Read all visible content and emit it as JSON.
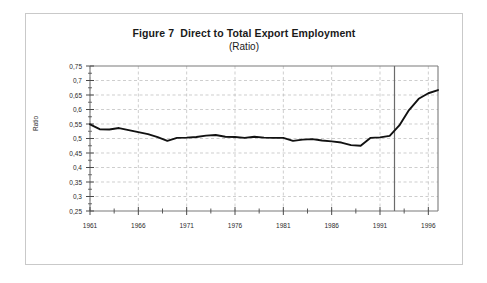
{
  "figure": {
    "title": "Figure 7  Direct to Total Export Employment",
    "subtitle": "(Ratio)",
    "border_color": "#c9c9c9",
    "background": "#ffffff"
  },
  "axes": {
    "y_title": "Ratio",
    "y_ticks": [
      "0,75",
      "0,7",
      "0,65",
      "0,6",
      "0,55",
      "0,5",
      "0,45",
      "0,4",
      "0,35",
      "0,3",
      "0,25"
    ],
    "x_ticks": [
      "1961",
      "1966",
      "1971",
      "1976",
      "1981",
      "1986",
      "1991",
      "1996"
    ]
  },
  "chart_data": {
    "type": "line",
    "title": "Figure 7  Direct to Total Export Employment",
    "subtitle": "(Ratio)",
    "xlabel": "",
    "ylabel": "Ratio",
    "xlim": [
      1961,
      1997
    ],
    "ylim": [
      0.25,
      0.75
    ],
    "y_tick_values": [
      0.75,
      0.7,
      0.65,
      0.6,
      0.55,
      0.5,
      0.45,
      0.4,
      0.35,
      0.3,
      0.25
    ],
    "y_tick_labels": [
      "0,75",
      "0,7",
      "0,65",
      "0,6",
      "0,55",
      "0,5",
      "0,45",
      "0,4",
      "0,35",
      "0,3",
      "0,25"
    ],
    "x_tick_values": [
      1961,
      1966,
      1971,
      1976,
      1981,
      1986,
      1991,
      1996
    ],
    "x_tick_labels": [
      "1961",
      "1966",
      "1971",
      "1976",
      "1981",
      "1986",
      "1991",
      "1996"
    ],
    "x_minor_tick_interval": 2.5,
    "grid": {
      "horizontal": true,
      "vertical": true,
      "style": "dashed",
      "color": "#b9b9b9"
    },
    "legend": null,
    "decimal_separator": ",",
    "annotations": [
      {
        "type": "vertical-line",
        "name": "series-break-line",
        "x": 1992.5,
        "style": "solid",
        "color": "#6b6b6b"
      }
    ],
    "series": [
      {
        "name": "Direct to Total Export Employment",
        "color": "#111111",
        "line_width": 1.9,
        "x": [
          1961,
          1962,
          1963,
          1964,
          1965,
          1966,
          1967,
          1968,
          1969,
          1970,
          1971,
          1972,
          1973,
          1974,
          1975,
          1976,
          1977,
          1978,
          1979,
          1980,
          1981,
          1982,
          1983,
          1984,
          1985,
          1986,
          1987,
          1988,
          1989,
          1990,
          1991,
          1992,
          1993,
          1994,
          1995,
          1996,
          1997
        ],
        "values": [
          0.549,
          0.532,
          0.531,
          0.536,
          0.529,
          0.522,
          0.515,
          0.505,
          0.492,
          0.502,
          0.503,
          0.505,
          0.51,
          0.512,
          0.506,
          0.505,
          0.502,
          0.506,
          0.503,
          0.502,
          0.502,
          0.492,
          0.496,
          0.498,
          0.493,
          0.49,
          0.486,
          0.477,
          0.475,
          0.502,
          0.504,
          0.509,
          0.545,
          0.598,
          0.637,
          0.656,
          0.667
        ]
      }
    ]
  }
}
